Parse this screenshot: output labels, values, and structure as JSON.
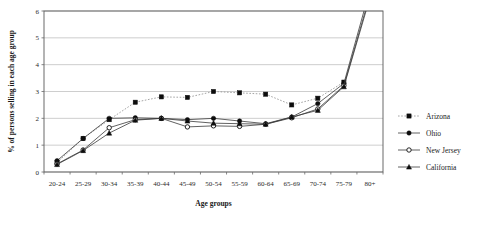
{
  "chart_data": {
    "type": "line",
    "title": "",
    "xlabel": "Age groups",
    "ylabel": "% of persons selling in each age group",
    "categories": [
      "20-24",
      "25-29",
      "30-34",
      "35-39",
      "40-44",
      "45-49",
      "50-54",
      "55-59",
      "60-64",
      "65-69",
      "70-74",
      "75-79",
      "80+"
    ],
    "ylim": [
      0,
      6
    ],
    "yticks": [
      0,
      1,
      2,
      3,
      4,
      5,
      6
    ],
    "ytick_labels": [
      "0",
      "1",
      "2",
      "3",
      "4",
      "5",
      "6"
    ],
    "grid": true,
    "legend_position": "right",
    "series": [
      {
        "name": "Arizona",
        "marker": "square",
        "marker_fill": "filled",
        "line_style": "dotted",
        "color": "#8d8d8d",
        "values": [
          0.35,
          1.25,
          1.95,
          2.6,
          2.8,
          2.78,
          3.0,
          2.95,
          2.9,
          2.5,
          2.75,
          3.35,
          null
        ]
      },
      {
        "name": "Ohio",
        "marker": "circle",
        "marker_fill": "filled",
        "line_style": "solid",
        "color": "#3a3a3a",
        "values": [
          0.42,
          1.25,
          2.0,
          2.02,
          2.0,
          1.95,
          2.0,
          1.9,
          1.8,
          2.05,
          2.55,
          3.3,
          6.8
        ]
      },
      {
        "name": "New Jersey",
        "marker": "circle",
        "marker_fill": "open",
        "line_style": "solid",
        "color": "#3a3a3a",
        "values": [
          0.3,
          0.82,
          1.65,
          1.95,
          2.0,
          1.68,
          1.72,
          1.7,
          1.78,
          2.02,
          2.35,
          3.22,
          6.6
        ]
      },
      {
        "name": "California",
        "marker": "triangle",
        "marker_fill": "filled",
        "line_style": "solid",
        "color": "#3a3a3a",
        "values": [
          0.28,
          0.8,
          1.45,
          1.93,
          2.0,
          1.9,
          1.82,
          1.8,
          1.78,
          2.05,
          2.3,
          3.18,
          6.5
        ]
      }
    ]
  }
}
